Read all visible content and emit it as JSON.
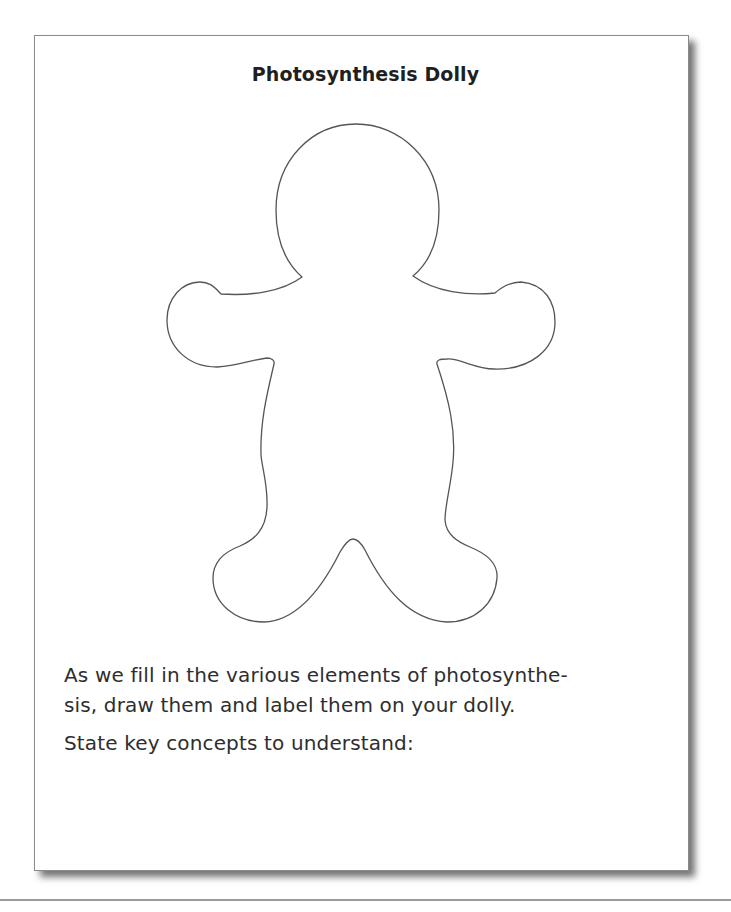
{
  "worksheet": {
    "title": "Photosynthesis Dolly",
    "figure": {
      "name": "gingerbread-dolly-outline",
      "stroke_color": "#555555",
      "fill_color": "#ffffff"
    },
    "instructions": {
      "line1": "As we fill in the various elements of photosynthe-",
      "line2": "sis, draw them and label them on your dolly."
    },
    "prompt": "State key concepts to understand:",
    "answer_area": ""
  },
  "colors": {
    "border": "#8a8a8a",
    "text": "#2e2e2e",
    "title": "#1f1f1f",
    "rule": "#9a9a9a"
  }
}
